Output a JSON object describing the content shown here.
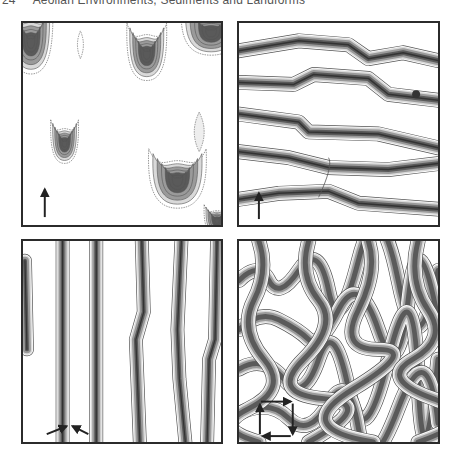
{
  "header": {
    "page_number": "24",
    "running_title": "Aeolian Environments, Sediments and Landforms"
  },
  "figure": {
    "panels": [
      {
        "id": "barchan",
        "label": "Barchan dunes (unidirectional wind)",
        "wind_arrows": [
          "up"
        ]
      },
      {
        "id": "transverse",
        "label": "Transverse dunes (unidirectional wind)",
        "wind_arrows": [
          "up"
        ]
      },
      {
        "id": "linear",
        "label": "Linear dunes (bidirectional wind)",
        "wind_arrows": [
          "up-right",
          "up-left"
        ]
      },
      {
        "id": "network",
        "label": "Network dunes (multidirectional wind)",
        "wind_arrows": [
          "right",
          "down",
          "left",
          "up"
        ]
      }
    ],
    "colors": {
      "border": "#2b2b2b",
      "contour_line": "#555555",
      "fill_light": "#d9d9d9",
      "fill_mid": "#9a9a9a",
      "fill_dark": "#5a5a5a",
      "arrow": "#222222"
    }
  }
}
